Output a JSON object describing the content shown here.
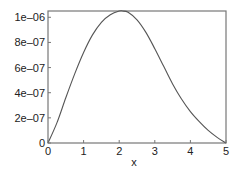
{
  "chart_data": {
    "type": "line",
    "title": "",
    "xlabel": "x",
    "ylabel": "",
    "xlim": [
      0,
      5
    ],
    "ylim": [
      0,
      1.05e-06
    ],
    "grid": false,
    "legend": null,
    "x_ticks": [
      0,
      1,
      2,
      3,
      4,
      5
    ],
    "x_tick_labels": [
      "0",
      "1",
      "2",
      "3",
      "4",
      "5"
    ],
    "y_ticks": [
      0,
      2e-07,
      4e-07,
      6e-07,
      8e-07,
      1e-06
    ],
    "y_tick_labels": [
      "0",
      "2e–07",
      "4e–07",
      "6e–07",
      "8e–07",
      "1e–06"
    ],
    "series": [
      {
        "name": "f(x)",
        "color": "#555555",
        "x": [
          0,
          0.25,
          0.5,
          0.75,
          1.0,
          1.25,
          1.5,
          1.75,
          2.0,
          2.1,
          2.25,
          2.5,
          2.75,
          3.0,
          3.25,
          3.5,
          3.75,
          4.0,
          4.25,
          4.5,
          4.75,
          5.0
        ],
        "y": [
          0,
          1.6e-07,
          3.6e-07,
          5.5e-07,
          7.2e-07,
          8.6e-07,
          9.6e-07,
          1.02e-06,
          1.05e-06,
          1.05e-06,
          1.04e-06,
          9.8e-07,
          8.8e-07,
          7.5e-07,
          6.1e-07,
          4.7e-07,
          3.5e-07,
          2.5e-07,
          1.7e-07,
          1e-07,
          4.5e-08,
          0
        ]
      }
    ]
  },
  "plot_area": {
    "left": 48,
    "top": 11,
    "right": 226,
    "bottom": 143
  },
  "colors": {
    "frame": "#777777",
    "curve": "#555555",
    "text": "#222222",
    "background": "#ffffff"
  }
}
